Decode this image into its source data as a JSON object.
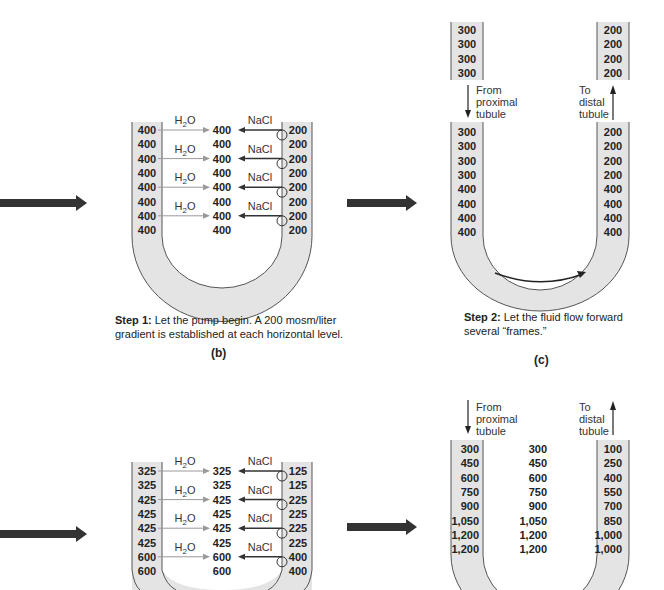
{
  "panel_b": {
    "letter": "(b)",
    "step_label": "Step 1:",
    "caption": "Let the pump begin.  A 200 mosm/liter gradient is established at each horizontal level.",
    "caption_line1": "Let the pump begin.  A 200 mosm/liter",
    "caption_line2": "gradient is established at each horizontal level.",
    "descending": [
      "400",
      "400",
      "400",
      "400",
      "400",
      "400",
      "400",
      "400"
    ],
    "interstitial": [
      "400",
      "400",
      "400",
      "400",
      "400",
      "400",
      "400",
      "400"
    ],
    "ascending": [
      "200",
      "200",
      "200",
      "200",
      "200",
      "200",
      "200",
      "200"
    ],
    "water_label": "H2O",
    "salt_label": "NaCl"
  },
  "panel_c": {
    "letter": "(c)",
    "step_label": "Step 2:",
    "caption_line1": "Let the fluid flow forward",
    "caption_line2": "several “frames.”",
    "top_descending": [
      "300",
      "300",
      "300",
      "300"
    ],
    "top_ascending": [
      "200",
      "200",
      "200",
      "200"
    ],
    "from_label": [
      "From",
      "proximal",
      "tubule"
    ],
    "to_label": [
      "To",
      "distal",
      "tubule"
    ],
    "descending": [
      "300",
      "300",
      "300",
      "300",
      "400",
      "400",
      "400",
      "400"
    ],
    "ascending": [
      "200",
      "200",
      "200",
      "200",
      "400",
      "400",
      "400",
      "400"
    ]
  },
  "panel_d": {
    "descending": [
      "325",
      "325",
      "425",
      "425",
      "425",
      "425",
      "600",
      "600"
    ],
    "interstitial": [
      "325",
      "325",
      "425",
      "425",
      "425",
      "425",
      "600",
      "600"
    ],
    "ascending": [
      "125",
      "125",
      "225",
      "225",
      "225",
      "225",
      "400",
      "400"
    ],
    "water_label": "H2O",
    "salt_label": "NaCl"
  },
  "panel_e": {
    "from_label": [
      "From",
      "proximal",
      "tubule"
    ],
    "to_label": [
      "To",
      "distal",
      "tubule"
    ],
    "descending": [
      "300",
      "450",
      "600",
      "750",
      "900",
      "1,050",
      "1,200",
      "1,200"
    ],
    "interstitial": [
      "300",
      "450",
      "600",
      "750",
      "900",
      "1,050",
      "1,200",
      "1,200"
    ],
    "ascending": [
      "100",
      "250",
      "400",
      "550",
      "700",
      "850",
      "1,000",
      "1,000"
    ]
  },
  "colors": {
    "tube_fill": "#e4e4e4",
    "arrow": "#333333",
    "line": "#555555",
    "water_arrow": "#9a9a9a"
  }
}
